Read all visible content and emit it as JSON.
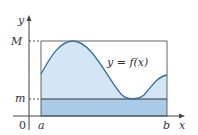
{
  "diagram": {
    "type": "function-bounds",
    "axis_labels": {
      "x": "x",
      "y": "y",
      "origin": "0"
    },
    "level_labels": {
      "max": "M",
      "min": "m"
    },
    "interval_labels": {
      "left": "a",
      "right": "b"
    },
    "curve_label": "y = f(x)",
    "colors": {
      "curve": "#3a6d9a",
      "upper_fill": "#d4e6f5",
      "lower_fill": "#a9cbe8",
      "axis": "#444444",
      "rect": "#555555"
    }
  }
}
